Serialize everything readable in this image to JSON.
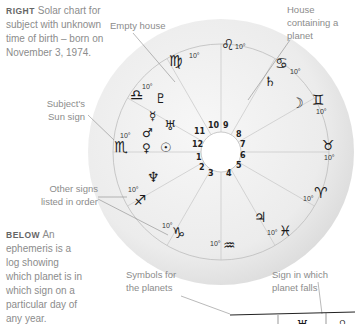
{
  "captions": {
    "right": {
      "lead": "RIGHT",
      "text": "Solar chart for subject with unknown time of birth – born on November 3, 1974."
    },
    "below": {
      "lead": "BELOW",
      "text": "An ephemeris is a log showing which planet is in which sign on a particular day of any year."
    }
  },
  "annotations": {
    "empty_house": "Empty house",
    "house_planet_1": "House",
    "house_planet_2": "containing a",
    "house_planet_3": "planet",
    "sun_sign_1": "Subject's",
    "sun_sign_2": "Sun sign",
    "other_signs_1": "Other signs",
    "other_signs_2": "listed in order",
    "symbols_1": "Symbols for",
    "symbols_2": "the planets",
    "sign_falls_1": "Sign in which",
    "sign_falls_2": "planet falls"
  },
  "chart": {
    "degree_label": "10°",
    "signs": [
      {
        "name": "leo",
        "glyph": "♌"
      },
      {
        "name": "cancer",
        "glyph": "♋"
      },
      {
        "name": "gemini",
        "glyph": "♊"
      },
      {
        "name": "taurus",
        "glyph": "♉"
      },
      {
        "name": "aries",
        "glyph": "♈"
      },
      {
        "name": "pisces",
        "glyph": "♓"
      },
      {
        "name": "aquarius",
        "glyph": "♒"
      },
      {
        "name": "capricorn",
        "glyph": "♑"
      },
      {
        "name": "sagittarius",
        "glyph": "♐"
      },
      {
        "name": "scorpio",
        "glyph": "♏"
      },
      {
        "name": "libra",
        "glyph": "♎"
      },
      {
        "name": "virgo",
        "glyph": "♍"
      }
    ],
    "planets": [
      {
        "name": "saturn",
        "glyph": "♄"
      },
      {
        "name": "moon",
        "glyph": "☽"
      },
      {
        "name": "pluto",
        "glyph": "♇"
      },
      {
        "name": "mercury",
        "glyph": "☿"
      },
      {
        "name": "uranus",
        "glyph": "♅"
      },
      {
        "name": "mars",
        "glyph": "♂"
      },
      {
        "name": "venus",
        "glyph": "♀"
      },
      {
        "name": "sun",
        "glyph": "☉"
      },
      {
        "name": "neptune",
        "glyph": "♆"
      },
      {
        "name": "jupiter",
        "glyph": "♃"
      }
    ],
    "houses": [
      "1",
      "2",
      "3",
      "4",
      "5",
      "6",
      "7",
      "8",
      "9",
      "10",
      "11",
      "12"
    ]
  },
  "ephemeris_preview": {
    "cells": [
      "♅",
      "♌"
    ]
  }
}
